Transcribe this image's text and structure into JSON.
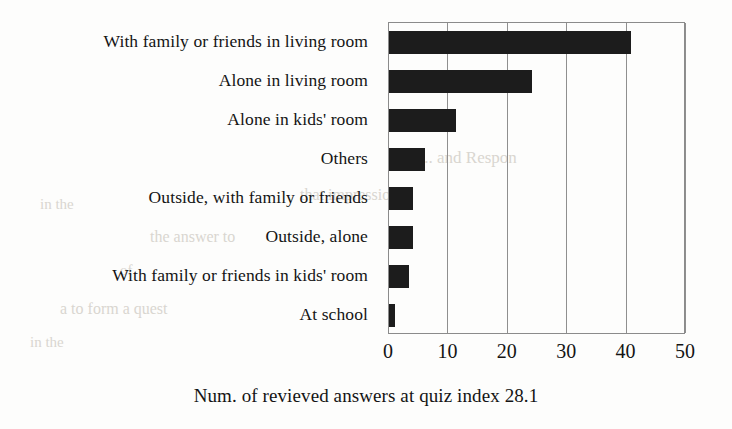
{
  "chart_data": {
    "type": "bar",
    "orientation": "horizontal",
    "title": "",
    "subtitle": "",
    "xlabel": "Num. of revieved answers at quiz index 28.1",
    "ylabel": "",
    "xlim": [
      0,
      50
    ],
    "xticks": [
      0,
      10,
      20,
      30,
      40,
      50
    ],
    "xtick_labels": [
      "0",
      "10",
      "20",
      "30",
      "40",
      "50"
    ],
    "grid": true,
    "grid_axis": "x",
    "legend": false,
    "legend_position": "none",
    "bar_color": "#1c1c1c",
    "categories": [
      "With family or friends in living room",
      "Alone in living room",
      "Alone in kids' room",
      "Others",
      "Outside, with family or friends",
      "Outside, alone",
      "With family or friends in kids' room",
      "At school"
    ],
    "values": [
      40.7,
      24.0,
      11.2,
      6.0,
      4.0,
      4.0,
      3.3,
      1.0
    ]
  },
  "background_artifacts": [
    {
      "text": "...  and  Respon",
      "x": 420,
      "y": 148,
      "size": 17
    },
    {
      "text": "that impression",
      "x": 300,
      "y": 186,
      "size": 16
    },
    {
      "text": "in the",
      "x": 40,
      "y": 196,
      "size": 15
    },
    {
      "text": "the answer  to",
      "x": 150,
      "y": 228,
      "size": 16
    },
    {
      "text": "of",
      "x": 120,
      "y": 262,
      "size": 15
    },
    {
      "text": "a  to  form  a  quest",
      "x": 60,
      "y": 300,
      "size": 16
    },
    {
      "text": "in the",
      "x": 30,
      "y": 334,
      "size": 15
    }
  ]
}
